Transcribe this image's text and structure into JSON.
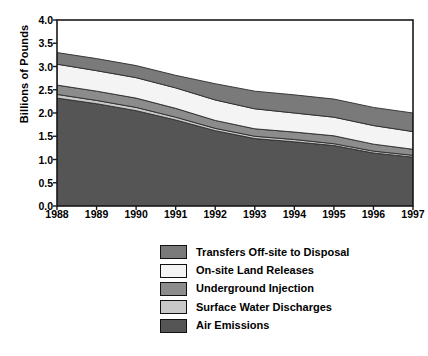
{
  "chart_data": {
    "type": "area",
    "stacked": true,
    "title": "",
    "xlabel": "",
    "ylabel": "Billions of Pounds",
    "x": [
      1988,
      1989,
      1990,
      1991,
      1992,
      1993,
      1994,
      1995,
      1996,
      1997
    ],
    "categories": [
      "1988",
      "1989",
      "1990",
      "1991",
      "1992",
      "1993",
      "1994",
      "1995",
      "1996",
      "1997"
    ],
    "ylim": [
      0.0,
      4.0
    ],
    "yticks": [
      "0.0",
      "0.5",
      "1.0",
      "1.5",
      "2.0",
      "2.5",
      "3.0",
      "3.5",
      "4.0"
    ],
    "ytick_values": [
      0.0,
      0.5,
      1.0,
      1.5,
      2.0,
      2.5,
      3.0,
      3.5,
      4.0
    ],
    "grid": false,
    "legend_position": "below-center",
    "stack_order_bottom_to_top": [
      "Air Emissions",
      "Surface Water Discharges",
      "Underground Injection",
      "On-site Land Releases",
      "Transfers Off-site to Disposal"
    ],
    "series": [
      {
        "name": "Air Emissions",
        "color": "#555555",
        "values": [
          2.32,
          2.2,
          2.05,
          1.85,
          1.62,
          1.45,
          1.38,
          1.3,
          1.14,
          1.05
        ]
      },
      {
        "name": "Surface Water Discharges",
        "color": "#c9c9c9",
        "values": [
          0.08,
          0.07,
          0.07,
          0.06,
          0.05,
          0.05,
          0.05,
          0.04,
          0.04,
          0.04
        ]
      },
      {
        "name": "Underground Injection",
        "color": "#8c8c8c",
        "values": [
          0.2,
          0.2,
          0.2,
          0.19,
          0.17,
          0.16,
          0.16,
          0.17,
          0.15,
          0.13
        ]
      },
      {
        "name": "On-site Land Releases",
        "color": "#f4f4f4",
        "values": [
          0.45,
          0.44,
          0.44,
          0.44,
          0.44,
          0.43,
          0.41,
          0.4,
          0.4,
          0.38
        ]
      },
      {
        "name": "Transfers Off-site to Disposal",
        "color": "#7a7a7a",
        "values": [
          0.25,
          0.26,
          0.26,
          0.27,
          0.35,
          0.38,
          0.39,
          0.39,
          0.39,
          0.4
        ]
      }
    ],
    "totals": [
      3.3,
      3.17,
      3.02,
      2.81,
      2.63,
      2.47,
      2.39,
      2.3,
      2.12,
      2.0
    ]
  },
  "legend": {
    "items": [
      {
        "label": "Transfers Off-site to Disposal",
        "color": "#7a7a7a"
      },
      {
        "label": "On-site Land Releases",
        "color": "#f4f4f4"
      },
      {
        "label": "Underground Injection",
        "color": "#8c8c8c"
      },
      {
        "label": "Surface Water Discharges",
        "color": "#c9c9c9"
      },
      {
        "label": "Air Emissions",
        "color": "#555555"
      }
    ]
  },
  "axes": {
    "y_label": "Billions of Pounds",
    "y_ticks": [
      "4.0",
      "3.5",
      "3.0",
      "2.5",
      "2.0",
      "1.5",
      "1.0",
      "0.5",
      "0.0"
    ],
    "x_ticks": [
      "1988",
      "1989",
      "1990",
      "1991",
      "1992",
      "1993",
      "1994",
      "1995",
      "1996",
      "1997"
    ]
  },
  "colors": {
    "frame": "#1a1a1a",
    "background": "#ffffff"
  }
}
